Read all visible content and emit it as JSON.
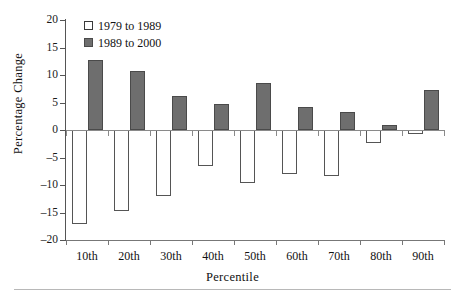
{
  "chart_data": {
    "type": "bar",
    "title": "",
    "xlabel": "Percentile",
    "ylabel": "Percentage Change",
    "categories": [
      "10th",
      "20th",
      "30th",
      "40th",
      "50th",
      "60th",
      "70th",
      "80th",
      "90th"
    ],
    "series": [
      {
        "name": "1979 to 1989",
        "values": [
          -17.1,
          -14.8,
          -12.0,
          -6.6,
          -9.7,
          -8.0,
          -8.4,
          -2.3,
          -0.8
        ]
      },
      {
        "name": "1989 to 2000",
        "values": [
          12.7,
          10.8,
          6.2,
          4.7,
          8.5,
          4.2,
          3.3,
          1.0,
          7.3
        ]
      }
    ],
    "ylim": [
      -20,
      20
    ],
    "yticks": [
      20,
      15,
      10,
      5,
      0,
      -5,
      -10,
      -15,
      -20
    ],
    "ytick_labels": [
      "20",
      "15",
      "10",
      "5",
      "0",
      "–5",
      "–10",
      "–15",
      "–20"
    ],
    "grid": false,
    "legend_position": "top-left",
    "zero_line": true
  },
  "legend": {
    "items": [
      {
        "label": "1979 to 1989",
        "swatch": "open-square-swatch",
        "color": "#ffffff"
      },
      {
        "label": "1989 to 2000",
        "swatch": "filled-square-swatch",
        "color": "#6e6e6e"
      }
    ]
  },
  "colors": {
    "series_a_fill": "#ffffff",
    "series_a_stroke": "#555555",
    "series_b_fill": "#6e6e6e",
    "series_b_stroke": "#4a4a4a",
    "axis": "#555555",
    "text": "#111111"
  }
}
